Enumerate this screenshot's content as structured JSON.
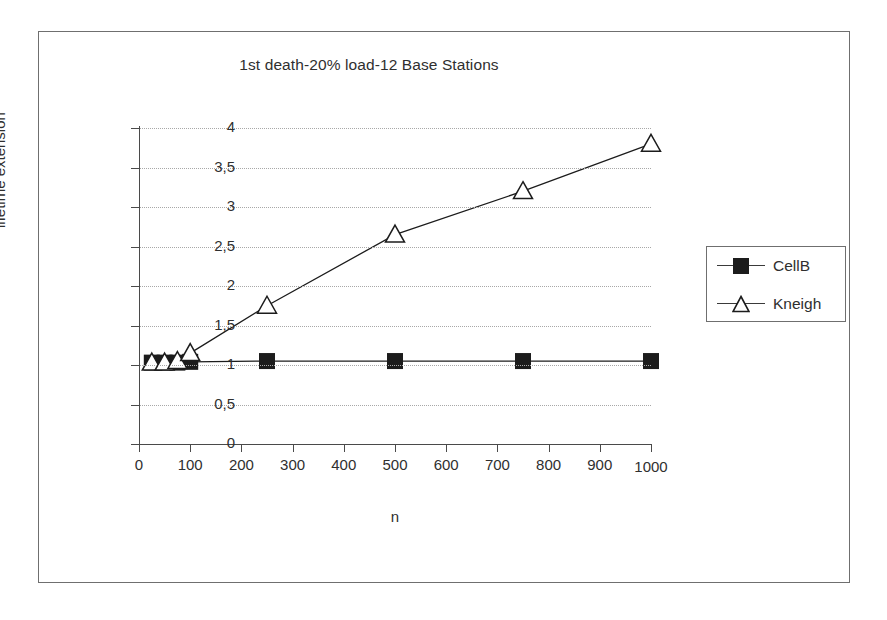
{
  "chart_data": {
    "type": "line",
    "title": "1st death-20% load-12 Base Stations",
    "xlabel": "n",
    "ylabel": "lifetime extension",
    "xlim": [
      0,
      1000
    ],
    "ylim": [
      0,
      4
    ],
    "grid": true,
    "legend_position": "right",
    "x_tick_labels": [
      "0",
      "100",
      "200",
      "300",
      "400",
      "500",
      "600",
      "700",
      "800",
      "900",
      "1000"
    ],
    "x_tick_values": [
      0,
      100,
      200,
      300,
      400,
      500,
      600,
      700,
      800,
      900,
      1000
    ],
    "y_tick_labels": [
      "0",
      "0,5",
      "1",
      "1,5",
      "2",
      "2,5",
      "3",
      "3,5",
      "4"
    ],
    "y_tick_values": [
      0,
      0.5,
      1,
      1.5,
      2,
      2.5,
      3,
      3.5,
      4
    ],
    "series": [
      {
        "name": "CellB",
        "marker": "filled-square",
        "color": "#1c1c1c",
        "x": [
          25,
          50,
          75,
          100,
          250,
          500,
          750,
          1000
        ],
        "values": [
          1.03,
          1.03,
          1.03,
          1.04,
          1.05,
          1.05,
          1.05,
          1.05
        ]
      },
      {
        "name": "Kneigh",
        "marker": "open-triangle",
        "color": "#1c1c1c",
        "x": [
          25,
          50,
          75,
          100,
          250,
          500,
          750,
          1000
        ],
        "values": [
          1.03,
          1.03,
          1.05,
          1.15,
          1.75,
          2.65,
          3.2,
          3.8
        ]
      }
    ]
  },
  "legend": {
    "entries": [
      {
        "label": "CellB",
        "marker": "filled-square"
      },
      {
        "label": "Kneigh",
        "marker": "open-triangle"
      }
    ]
  },
  "axes": {
    "y_title": "lifetime extension",
    "x_title": "n"
  }
}
